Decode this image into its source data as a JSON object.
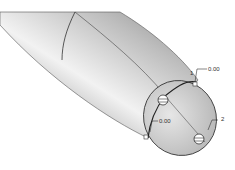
{
  "model": {
    "description": "Curved tube end with filleted dome, CAD shaded view",
    "colors": {
      "tube_light": "#f2f2f2",
      "tube_mid": "#b8b8b8",
      "tube_dark": "#7a7a7a",
      "cap": "#d6d6d6",
      "edge": "#3a3a3a"
    }
  },
  "annotations": {
    "point_1": {
      "index": "1",
      "value": "0.00"
    },
    "point_2": {
      "index": "2"
    },
    "point_3": {
      "value": "0.00"
    }
  }
}
